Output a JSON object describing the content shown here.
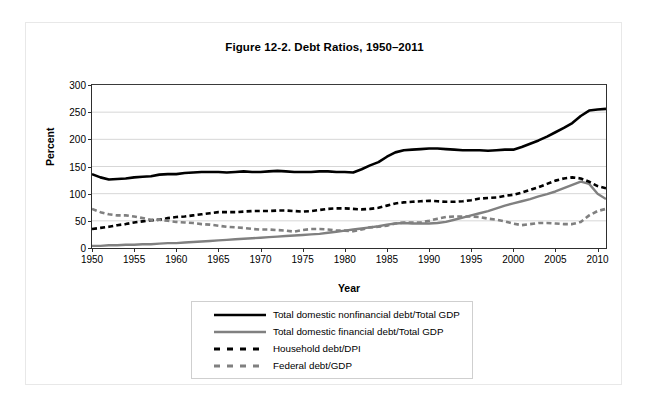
{
  "figure": {
    "title": "Figure 12-2. Debt Ratios, 1950–2011"
  },
  "chart_data": {
    "type": "line",
    "title": "Figure 12-2. Debt Ratios, 1950–2011",
    "xlabel": "Year",
    "ylabel": "Percent",
    "xlim": [
      1950,
      2011
    ],
    "ylim": [
      0,
      300
    ],
    "ytick_labels": [
      "0",
      "50",
      "100",
      "150",
      "200",
      "250",
      "300"
    ],
    "yticks": [
      0,
      50,
      100,
      150,
      200,
      250,
      300
    ],
    "xticks": [
      1950,
      1955,
      1960,
      1965,
      1970,
      1975,
      1980,
      1985,
      1990,
      1995,
      2000,
      2005,
      2010
    ],
    "xtick_labels": [
      "1950",
      "1955",
      "1960",
      "1965",
      "1970",
      "1975",
      "1980",
      "1985",
      "1990",
      "1995",
      "2000",
      "2005",
      "2010"
    ],
    "grid": "horizontal",
    "legend_position": "below-plot",
    "x": [
      1950,
      1951,
      1952,
      1953,
      1954,
      1955,
      1956,
      1957,
      1958,
      1959,
      1960,
      1961,
      1962,
      1963,
      1964,
      1965,
      1966,
      1967,
      1968,
      1969,
      1970,
      1971,
      1972,
      1973,
      1974,
      1975,
      1976,
      1977,
      1978,
      1979,
      1980,
      1981,
      1982,
      1983,
      1984,
      1985,
      1986,
      1987,
      1988,
      1989,
      1990,
      1991,
      1992,
      1993,
      1994,
      1995,
      1996,
      1997,
      1998,
      1999,
      2000,
      2001,
      2002,
      2003,
      2004,
      2005,
      2006,
      2007,
      2008,
      2009,
      2010,
      2011
    ],
    "series": [
      {
        "name": "Total domestic nonfinancial debt/Total GDP",
        "color": "#000000",
        "style": "solid",
        "width": 2.6,
        "values": [
          136,
          130,
          126,
          127,
          128,
          130,
          131,
          132,
          135,
          136,
          136,
          138,
          139,
          140,
          140,
          140,
          139,
          140,
          141,
          140,
          140,
          141,
          142,
          141,
          140,
          140,
          140,
          141,
          141,
          140,
          140,
          139,
          145,
          152,
          158,
          168,
          176,
          180,
          181,
          182,
          183,
          183,
          182,
          181,
          180,
          180,
          180,
          179,
          180,
          181,
          181,
          186,
          192,
          198,
          205,
          213,
          221,
          230,
          243,
          253,
          255,
          256
        ]
      },
      {
        "name": "Total domestic financial debt/Total GDP",
        "color": "#808080",
        "style": "solid",
        "width": 2.4,
        "values": [
          4,
          4,
          5,
          5,
          6,
          6,
          7,
          7,
          8,
          9,
          9,
          10,
          11,
          12,
          13,
          14,
          15,
          16,
          17,
          18,
          19,
          20,
          21,
          22,
          23,
          24,
          25,
          26,
          28,
          30,
          32,
          34,
          36,
          38,
          40,
          43,
          45,
          46,
          45,
          45,
          45,
          46,
          48,
          52,
          56,
          60,
          64,
          68,
          73,
          78,
          82,
          86,
          90,
          95,
          99,
          104,
          110,
          116,
          122,
          118,
          100,
          90
        ]
      },
      {
        "name": "Household debt/DPI",
        "color": "#000000",
        "style": "dashed",
        "width": 2.6,
        "values": [
          35,
          37,
          39,
          42,
          44,
          47,
          49,
          51,
          52,
          55,
          57,
          58,
          60,
          62,
          64,
          66,
          66,
          66,
          67,
          68,
          68,
          68,
          69,
          69,
          68,
          67,
          68,
          70,
          72,
          73,
          73,
          72,
          71,
          72,
          74,
          78,
          82,
          84,
          85,
          86,
          87,
          86,
          85,
          85,
          86,
          88,
          91,
          92,
          93,
          96,
          98,
          102,
          107,
          112,
          118,
          124,
          128,
          130,
          128,
          122,
          114,
          110
        ]
      },
      {
        "name": "Federal debt/GDP",
        "color": "#808080",
        "style": "dashed",
        "width": 2.6,
        "values": [
          72,
          66,
          62,
          60,
          60,
          58,
          55,
          52,
          52,
          50,
          48,
          47,
          46,
          44,
          43,
          41,
          39,
          38,
          37,
          35,
          34,
          34,
          33,
          32,
          30,
          33,
          35,
          35,
          34,
          32,
          32,
          31,
          34,
          38,
          39,
          41,
          45,
          47,
          47,
          47,
          50,
          54,
          57,
          58,
          58,
          58,
          57,
          54,
          52,
          49,
          45,
          42,
          44,
          46,
          46,
          45,
          44,
          44,
          48,
          60,
          68,
          72
        ]
      }
    ]
  },
  "legend": {
    "items": [
      {
        "label": "Total domestic nonfinancial debt/Total GDP",
        "color": "#000000",
        "style": "solid"
      },
      {
        "label": "Total domestic financial debt/Total GDP",
        "color": "#808080",
        "style": "solid"
      },
      {
        "label": "Household debt/DPI",
        "color": "#000000",
        "style": "dashed"
      },
      {
        "label": "Federal debt/GDP",
        "color": "#808080",
        "style": "dashed"
      }
    ]
  }
}
